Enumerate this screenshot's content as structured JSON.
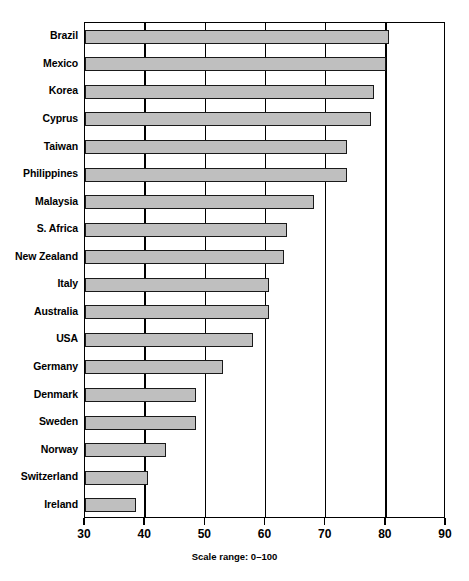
{
  "chart_data": {
    "type": "bar",
    "orientation": "horizontal",
    "title": "",
    "subtitle": "",
    "xlabel": "Scale range: 0–100",
    "ylabel": "",
    "xlim": [
      30,
      90
    ],
    "ylim": null,
    "grid": true,
    "legend": null,
    "legend_position": "none",
    "x_ticks": [
      30,
      40,
      50,
      60,
      70,
      80,
      90
    ],
    "x_tick_labels": [
      "30",
      "40",
      "50",
      "60",
      "70",
      "80",
      "90"
    ],
    "categories": [
      "Brazil",
      "Mexico",
      "Korea",
      "Cyprus",
      "Taiwan",
      "Philippines",
      "Malaysia",
      "S. Africa",
      "New Zealand",
      "Italy",
      "Australia",
      "USA",
      "Germany",
      "Denmark",
      "Sweden",
      "Norway",
      "Switzerland",
      "Ireland"
    ],
    "values": [
      80.5,
      80.0,
      78.0,
      77.5,
      73.5,
      73.5,
      68.0,
      63.5,
      63.0,
      60.5,
      60.5,
      58.0,
      53.0,
      48.5,
      48.5,
      43.5,
      40.5,
      38.5
    ],
    "series": [
      {
        "name": "Score",
        "values": [
          80.5,
          80.0,
          78.0,
          77.5,
          73.5,
          73.5,
          68.0,
          63.5,
          63.0,
          60.5,
          60.5,
          58.0,
          53.0,
          48.5,
          48.5,
          43.5,
          40.5,
          38.5
        ]
      }
    ],
    "bar_fill_color": "#bfbfbf",
    "bar_border_color": "#1a1a1a",
    "axis_color": "#000000",
    "background_color": "#ffffff"
  },
  "caption": {
    "text": "Scale range: 0–100"
  }
}
